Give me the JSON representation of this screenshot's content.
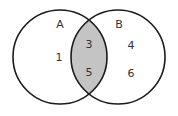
{
  "diagram": {
    "type": "venn",
    "sets": [
      {
        "name": "A",
        "only_elements": [
          "1"
        ]
      },
      {
        "name": "B",
        "only_elements": [
          "4",
          "6"
        ]
      }
    ],
    "intersection": {
      "elements": [
        "3",
        "5"
      ],
      "fill": "#c4c4c4"
    },
    "stroke_color": "#1a1a1a",
    "labels": {
      "set_a": "A",
      "set_b": "B",
      "a_only_1": "1",
      "both_1": "3",
      "both_2": "5",
      "b_only_1": "4",
      "b_only_2": "6"
    }
  }
}
